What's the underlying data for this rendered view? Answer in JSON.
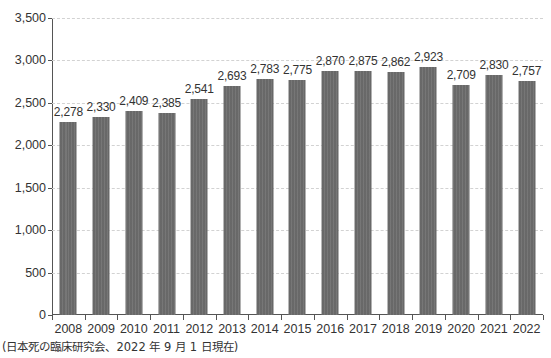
{
  "chart_data": {
    "type": "bar",
    "title": "",
    "subtitle": "",
    "xlabel": "",
    "ylabel": "",
    "categories": [
      "2008",
      "2009",
      "2010",
      "2011",
      "2012",
      "2013",
      "2014",
      "2015",
      "2016",
      "2017",
      "2018",
      "2019",
      "2020",
      "2021",
      "2022"
    ],
    "values": [
      2278,
      2330,
      2409,
      2385,
      2541,
      2693,
      2783,
      2775,
      2870,
      2875,
      2862,
      2923,
      2709,
      2830,
      2757
    ],
    "value_labels": [
      "2,278",
      "2,330",
      "2,409",
      "2,385",
      "2,541",
      "2,693",
      "2,783",
      "2,775",
      "2,870",
      "2,875",
      "2,862",
      "2,923",
      "2,709",
      "2,830",
      "2,757"
    ],
    "ylim": [
      0,
      3500
    ],
    "ytick_values": [
      0,
      500,
      1000,
      1500,
      2000,
      2500,
      3000,
      3500
    ],
    "ytick_labels": [
      "0",
      "500",
      "1,000",
      "1,500",
      "2,000",
      "2,500",
      "3,000",
      "3,500"
    ],
    "grid": true,
    "grid_style": "dashed",
    "legend": "none",
    "bar_color": "#6e6e6e",
    "grid_color": "#d2d2d2",
    "axis_color": "#555555",
    "text_color": "#333333"
  },
  "footnote": {
    "text": "(日本死の臨床研究会、2022 年 9 月 1 日現在)"
  }
}
